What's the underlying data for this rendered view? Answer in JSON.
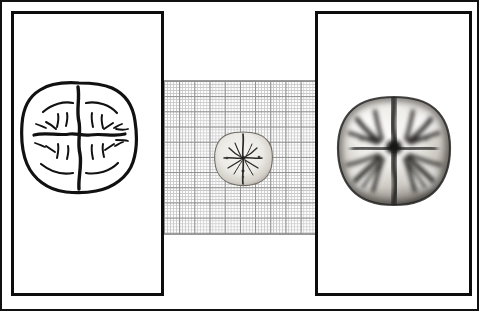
{
  "figure": {
    "title": "Occlusal surface of a molar tooth — three-panel comparison",
    "background_color": "#ffffff",
    "border_color": "#111111",
    "width": 479,
    "height": 311
  },
  "panels": [
    {
      "id": "left",
      "name": "line-drawing-panel",
      "content_label": "Schematic line drawing of molar occlusal surface",
      "border_color": "#0d0d0d",
      "fill_color": "#ffffff",
      "specimen": {
        "name": "molar-occlusal-line-drawing",
        "style": "ink outline",
        "features": [
          "crown outline with four rounded cusp lobes",
          "central cross-shaped fissure pattern",
          "mesiodistal (vertical) primary groove",
          "buccolingual (horizontal) primary groove",
          "radiating secondary grooves and marginal ridge lines"
        ],
        "stroke_color": "#111111"
      }
    },
    {
      "id": "centre",
      "name": "graph-paper-panel",
      "content_label": "Specimen photographed on graph paper for scale",
      "grid": {
        "minor_cell_px": 3.04,
        "major_cell_px": 15.2,
        "cells_per_major": 5,
        "minor_line_color": "#c9c9c9",
        "major_line_color": "#8d8d8d",
        "paper_color": "#fdfdfd"
      },
      "specimen": {
        "name": "molar-occlusal-photo-small",
        "style": "greyscale photograph, actual size",
        "features": [
          "pale enamel crown",
          "dark central fissure cross",
          "dark pits at groove terminations"
        ],
        "light_tone": "#f0efec",
        "mid_tone": "#9b978f",
        "dark_tone": "#2b2a28"
      }
    },
    {
      "id": "right",
      "name": "photograph-panel",
      "content_label": "Enlarged greyscale photograph of molar occlusal surface",
      "border_color": "#0d0d0d",
      "fill_color": "#ffffff",
      "specimen": {
        "name": "molar-occlusal-photo-large",
        "style": "greyscale photograph, magnified",
        "features": [
          "four cusps with convex enamel highlights",
          "deep dark mesiodistal fissure dividing the crown",
          "branching buccolingual fissures",
          "shadowed crown periphery"
        ],
        "light_tone": "#f2f1ee",
        "mid_tone": "#8e8a84",
        "dark_tone": "#1d1c1b"
      }
    }
  ]
}
